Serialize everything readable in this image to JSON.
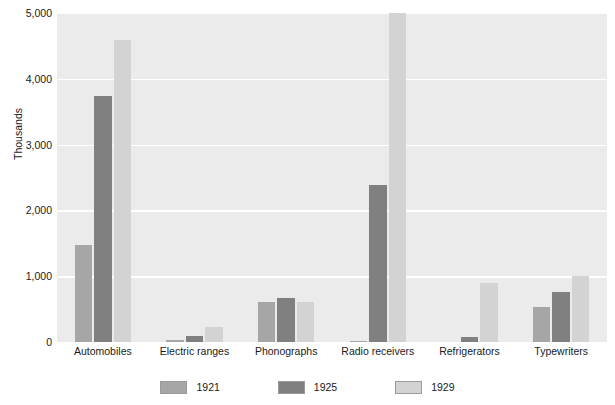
{
  "chart_data": {
    "type": "bar",
    "title": "",
    "xlabel": "",
    "ylabel": "Thousands",
    "ylim": [
      0,
      5000
    ],
    "yticks": [
      0,
      1000,
      2000,
      3000,
      4000,
      5000
    ],
    "ytick_labels": [
      "0",
      "1,000",
      "2,000",
      "3,000",
      "4,000",
      "5,000"
    ],
    "grid": true,
    "legend_position": "bottom",
    "categories": [
      "Automobiles",
      "Electric ranges",
      "Phonographs",
      "Radio receivers",
      "Refrigerators",
      "Typewriters"
    ],
    "series": [
      {
        "name": "1921",
        "color": "#a6a6a6",
        "values": [
          1468,
          34,
          608,
          8,
          5,
          531
        ]
      },
      {
        "name": "1925",
        "color": "#808080",
        "values": [
          3735,
          96,
          666,
          2381,
          75,
          755
        ]
      },
      {
        "name": "1929",
        "color": "#d3d3d3",
        "values": [
          4587,
          229,
          608,
          5000,
          897,
          996
        ]
      }
    ],
    "notes": {
      "clipped_series_note": "Radio receivers 1929 bar reaches the top of the axis at 5,000"
    }
  },
  "style": {
    "plot_background": "#ebebeb",
    "gridline_color": "#ffffff",
    "page_background": "#ffffff",
    "text_color": "#1a1a1a"
  }
}
